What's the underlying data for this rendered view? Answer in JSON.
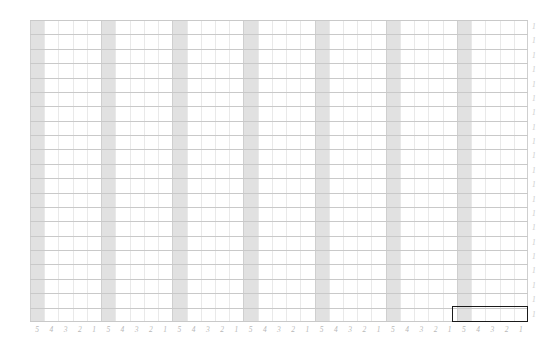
{
  "canvas": {
    "width": 560,
    "height": 357,
    "background_color": "#ffffff"
  },
  "grid": {
    "origin_x": 30,
    "origin_y": 20,
    "width": 498,
    "height": 302,
    "columns": 35,
    "rows": 21,
    "column_width": 14.23,
    "row_height": 14.38,
    "minor_line_color": "#e9e9e9",
    "major_line_color": "#c9c9c9",
    "shaded_column_color": "#d6d6d6",
    "shaded_column_indices": [
      0,
      5,
      10,
      15,
      20,
      25,
      30
    ]
  },
  "x_axis": {
    "label_color": "#b8b8b8",
    "group_pattern": [
      "5",
      "4",
      "3",
      "2",
      "1"
    ],
    "groups": 7,
    "labels": [
      "5",
      "4",
      "3",
      "2",
      "1",
      "5",
      "4",
      "3",
      "2",
      "1",
      "5",
      "4",
      "3",
      "2",
      "1",
      "5",
      "4",
      "3",
      "2",
      "1",
      "5",
      "4",
      "3",
      "2",
      "1",
      "5",
      "4",
      "3",
      "2",
      "1",
      "5",
      "4",
      "3",
      "2",
      "1"
    ]
  },
  "y_axis": {
    "label_color": "#cbcbcb",
    "labels": [
      "1",
      "1",
      "1",
      "1",
      "1",
      "1",
      "1",
      "1",
      "1",
      "1",
      "1",
      "1",
      "1",
      "1",
      "1",
      "1",
      "1",
      "1",
      "1",
      "1",
      "1"
    ]
  },
  "selection": {
    "name": "selection-rectangle",
    "border_color": "#1a1a1a",
    "start_column": 30,
    "end_column": 35,
    "row": 20,
    "left": 452,
    "top": 306,
    "width": 76,
    "height": 16
  }
}
